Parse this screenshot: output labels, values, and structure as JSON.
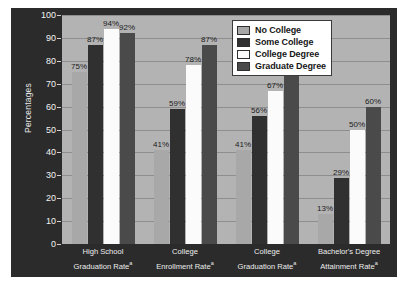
{
  "chart_data": {
    "type": "bar",
    "title": "",
    "xlabel": "",
    "ylabel": "Percentages",
    "ylim": [
      0,
      100
    ],
    "ytick_step": 10,
    "yticks": [
      "100",
      "90",
      "80",
      "70",
      "60",
      "50",
      "40",
      "30",
      "20",
      "10",
      "0"
    ],
    "grid": true,
    "legend_position": "top-right",
    "categories": [
      "High School\nGraduation Rate",
      "College\nEnrollment Rate",
      "College\nGraduation Rate",
      "Bachelor's Degree\nAttainment Rate"
    ],
    "category_parts": [
      {
        "line1": "High School",
        "line2": "Graduation Rate",
        "superscript": "a"
      },
      {
        "line1": "College",
        "line2": "Enrollment Rate",
        "superscript": "a"
      },
      {
        "line1": "College",
        "line2": "Graduation Rate",
        "superscript": "a"
      },
      {
        "line1": "Bachelor's Degree",
        "line2": "Attainment Rate",
        "superscript": "a"
      }
    ],
    "series": [
      {
        "name": "No College",
        "color": "#a8a8a8",
        "values": [
          75,
          41,
          41,
          13
        ],
        "labels": [
          "75%",
          "41%",
          "41%",
          "13%"
        ]
      },
      {
        "name": "Some College",
        "color": "#303030",
        "values": [
          87,
          59,
          56,
          29
        ],
        "labels": [
          "87%",
          "59%",
          "56%",
          "29%"
        ]
      },
      {
        "name": "College Degree",
        "color": "#fbfbfb",
        "values": [
          94,
          78,
          67,
          50
        ],
        "labels": [
          "94%",
          "78%",
          "67%",
          "50%"
        ]
      },
      {
        "name": "Graduate Degree",
        "color": "#4a4a4a",
        "values": [
          92,
          87,
          74,
          60
        ],
        "labels": [
          "92%",
          "87%",
          "74%",
          "60%"
        ]
      }
    ]
  },
  "legend": {
    "items": [
      {
        "label": "No College",
        "swatch_class": "sw-no-college"
      },
      {
        "label": "Some College",
        "swatch_class": "sw-some-college"
      },
      {
        "label": "College Degree",
        "swatch_class": "sw-college-degree"
      },
      {
        "label": "Graduate Degree",
        "swatch_class": "sw-graduate-degree"
      }
    ]
  },
  "colors": {
    "frame_background": "#2b2b2b",
    "plot_background": "#b3b3b3",
    "gridline": "#8e8e8e",
    "axis_text": "#f2f2f2",
    "data_label": "#1c1c1c",
    "legend_background": "#ffffff"
  }
}
